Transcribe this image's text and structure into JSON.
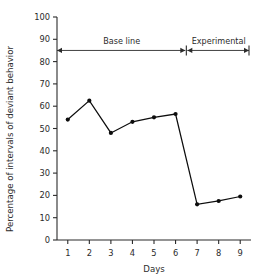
{
  "chart_data": {
    "type": "line",
    "title": "",
    "xlabel": "Days",
    "ylabel": "Percentage of intervals of deviant behavior",
    "x": [
      1,
      2,
      3,
      4,
      5,
      6,
      7,
      8,
      9
    ],
    "categories": [
      "1",
      "2",
      "3",
      "4",
      "5",
      "6",
      "7",
      "8",
      "9"
    ],
    "values": [
      54,
      62.5,
      48,
      53,
      55,
      56.5,
      16,
      17.5,
      19.5
    ],
    "xlim": [
      0.5,
      9.5
    ],
    "ylim": [
      0,
      100
    ],
    "ytick_labels": [
      "0",
      "10",
      "20",
      "30",
      "40",
      "50",
      "60",
      "70",
      "80",
      "90",
      "100"
    ],
    "ytick_values": [
      0,
      10,
      20,
      30,
      40,
      50,
      60,
      70,
      80,
      90,
      100
    ],
    "xtick_labels": [
      "1",
      "2",
      "3",
      "4",
      "5",
      "6",
      "7",
      "8",
      "9"
    ],
    "grid": false,
    "legend": "none",
    "series_color": "#0d0d0d",
    "marker": "filled-circle",
    "annotations": [
      {
        "label": "Base line",
        "start_day": 1,
        "end_day": 6,
        "level": 85
      },
      {
        "label": "Experimental",
        "start_day": 7,
        "end_day": 9,
        "level": 85
      }
    ],
    "phase_divider_between": [
      6,
      7
    ]
  },
  "axis": {
    "y_title": "Percentage of intervals of deviant behavior",
    "x_title": "Days"
  },
  "phases": {
    "baseline_label": "Base line",
    "experimental_label": "Experimental"
  }
}
